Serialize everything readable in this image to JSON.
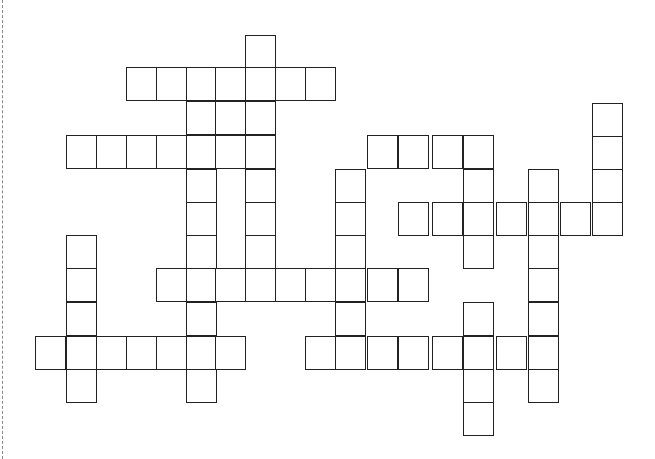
{
  "puzzle": {
    "type": "crossword",
    "cell_size": [
      30,
      33
    ],
    "line_color": "#222222",
    "background": "#ffffff",
    "cells": [
      [
        245,
        35
      ],
      [
        126,
        67
      ],
      [
        156,
        67
      ],
      [
        186,
        67
      ],
      [
        215,
        67
      ],
      [
        245,
        67
      ],
      [
        275,
        67
      ],
      [
        305,
        67
      ],
      [
        186,
        101
      ],
      [
        215,
        101
      ],
      [
        245,
        101
      ],
      [
        66,
        135
      ],
      [
        96,
        135
      ],
      [
        126,
        135
      ],
      [
        156,
        135
      ],
      [
        186,
        135
      ],
      [
        215,
        135
      ],
      [
        245,
        135
      ],
      [
        367,
        135
      ],
      [
        398,
        135
      ],
      [
        432,
        135
      ],
      [
        463,
        135
      ],
      [
        592,
        103
      ],
      [
        592,
        136
      ],
      [
        592,
        169
      ],
      [
        186,
        169
      ],
      [
        245,
        169
      ],
      [
        335,
        169
      ],
      [
        463,
        169
      ],
      [
        528,
        169
      ],
      [
        186,
        202
      ],
      [
        245,
        202
      ],
      [
        335,
        202
      ],
      [
        398,
        202
      ],
      [
        432,
        202
      ],
      [
        463,
        202
      ],
      [
        496,
        202
      ],
      [
        528,
        202
      ],
      [
        560,
        202
      ],
      [
        592,
        202
      ],
      [
        66,
        235
      ],
      [
        186,
        235
      ],
      [
        245,
        235
      ],
      [
        335,
        235
      ],
      [
        463,
        235
      ],
      [
        528,
        235
      ],
      [
        66,
        268
      ],
      [
        156,
        268
      ],
      [
        186,
        268
      ],
      [
        215,
        268
      ],
      [
        245,
        268
      ],
      [
        275,
        268
      ],
      [
        305,
        268
      ],
      [
        335,
        268
      ],
      [
        367,
        268
      ],
      [
        398,
        268
      ],
      [
        528,
        268
      ],
      [
        66,
        302
      ],
      [
        186,
        302
      ],
      [
        335,
        302
      ],
      [
        463,
        302
      ],
      [
        528,
        302
      ],
      [
        35,
        336
      ],
      [
        66,
        336
      ],
      [
        96,
        336
      ],
      [
        126,
        336
      ],
      [
        156,
        336
      ],
      [
        186,
        336
      ],
      [
        215,
        336
      ],
      [
        305,
        336
      ],
      [
        335,
        336
      ],
      [
        367,
        336
      ],
      [
        398,
        336
      ],
      [
        432,
        336
      ],
      [
        463,
        336
      ],
      [
        496,
        336
      ],
      [
        528,
        336
      ],
      [
        66,
        369
      ],
      [
        186,
        369
      ],
      [
        463,
        369
      ],
      [
        528,
        369
      ],
      [
        463,
        402
      ]
    ]
  }
}
